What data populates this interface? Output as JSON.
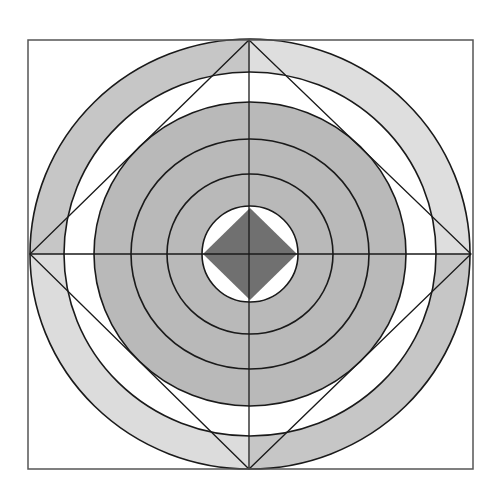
{
  "diagram": {
    "canvas": {
      "width": 499,
      "height": 501,
      "background": "#ffffff"
    },
    "frame": {
      "x": 28,
      "y": 40,
      "width": 445,
      "height": 429,
      "stroke": "#555555"
    },
    "center": {
      "cx": 250,
      "cy": 254
    },
    "stroke_color": "#1a1a1a",
    "outer_band": {
      "outer": {
        "rx": 220,
        "ry": 215
      },
      "inner": {
        "rx": 186,
        "ry": 182
      },
      "quadrant_fills": {
        "upper_left": "#c6c6c6",
        "upper_right": "#dedede",
        "lower_left": "#dcdcdc",
        "lower_right": "#c6c6c6"
      }
    },
    "gap_ring_fill": "#ffffff",
    "inner_disk": {
      "rx": 156,
      "ry": 152,
      "fill": "#b9b9b9",
      "ring_lines": [
        {
          "rx": 119,
          "ry": 115
        },
        {
          "rx": 83,
          "ry": 80
        }
      ]
    },
    "center_hole": {
      "rx": 48,
      "ry": 48,
      "fill": "#ffffff"
    },
    "center_diamond": {
      "half_w": 47,
      "half_h": 46,
      "fill": "#707070"
    },
    "outer_diamond": {
      "top": [
        249,
        40
      ],
      "right": [
        471,
        254
      ],
      "bottom": [
        249,
        469
      ],
      "left": [
        30,
        254
      ]
    },
    "axes": {
      "horizontal": {
        "x1": 30,
        "x2": 471,
        "y": 254
      },
      "vertical": {
        "x": 249,
        "y1": 40,
        "y2": 469
      }
    }
  }
}
